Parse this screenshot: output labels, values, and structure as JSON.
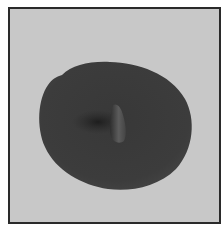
{
  "image": {
    "alt": "Grayscale photograph of a dark oval disc with a small raised nub near its center on a light gray background",
    "colors": {
      "border": "#2a2a2a",
      "background": "#c9c9c9",
      "disc": "#3a3a3a",
      "disc_shadow": "#1f1f1f",
      "nub_highlight": "#6a6a6a"
    }
  }
}
